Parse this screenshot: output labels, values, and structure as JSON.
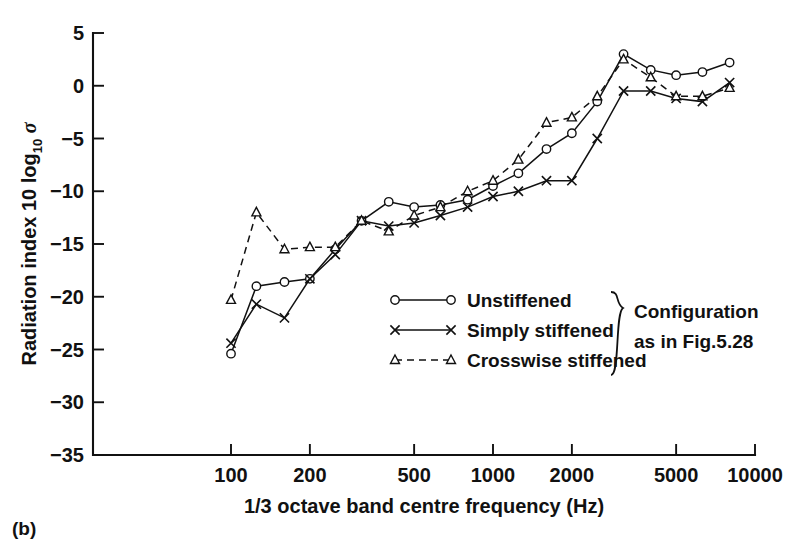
{
  "panel_label": "(b)",
  "axes": {
    "y_title_prefix": "Radiation index 10 log",
    "y_title_sub": "10",
    "y_title_symbol": "σ",
    "x_title": "1/3 octave band centre frequency (Hz)",
    "y_ticks": [
      "5",
      "0",
      "−5",
      "−10",
      "−15",
      "−20",
      "−25",
      "−30",
      "−35"
    ],
    "x_ticks": [
      "100",
      "200",
      "500",
      "1000",
      "2000",
      "5000",
      "10000"
    ]
  },
  "legend": {
    "items": [
      {
        "label": "Unstiffened",
        "marker": "circle",
        "dash": false
      },
      {
        "label": "Simply stiffened",
        "marker": "cross",
        "dash": false
      },
      {
        "label": "Crosswise stiffened",
        "marker": "triangle",
        "dash": true
      }
    ],
    "note_line1": "Configuration",
    "note_line2": "as in Fig.5.28"
  },
  "chart_data": {
    "type": "line",
    "title": "",
    "xlabel": "1/3 octave band centre frequency (Hz)",
    "ylabel": "Radiation index 10 log10 σ",
    "xscale": "log",
    "xlim": [
      80,
      10000
    ],
    "ylim": [
      -35,
      5
    ],
    "grid": false,
    "legend_position": "center-right",
    "x_tick_values": [
      100,
      200,
      500,
      1000,
      2000,
      5000,
      10000
    ],
    "y_tick_values": [
      5,
      0,
      -5,
      -10,
      -15,
      -20,
      -25,
      -30,
      -35
    ],
    "series": [
      {
        "name": "Unstiffened",
        "marker": "circle",
        "linestyle": "solid",
        "x": [
          100,
          125,
          160,
          200,
          250,
          315,
          400,
          500,
          630,
          800,
          1000,
          1250,
          1600,
          2000,
          2500,
          3150,
          4000,
          5000,
          6300,
          8000
        ],
        "values": [
          -25.4,
          -19.0,
          -18.6,
          -18.3,
          -15.5,
          -12.8,
          -11.0,
          -11.5,
          -11.3,
          -10.8,
          -9.5,
          -8.3,
          -6.0,
          -4.5,
          -1.5,
          3.0,
          1.5,
          1.0,
          1.3,
          2.2
        ]
      },
      {
        "name": "Simply stiffened",
        "marker": "cross",
        "linestyle": "solid",
        "x": [
          100,
          125,
          160,
          200,
          250,
          315,
          400,
          500,
          630,
          800,
          1000,
          1250,
          1600,
          2000,
          2500,
          3150,
          4000,
          5000,
          6300,
          8000
        ],
        "values": [
          -24.4,
          -20.7,
          -22.0,
          -18.3,
          -16.0,
          -12.8,
          -13.3,
          -13.0,
          -12.3,
          -11.5,
          -10.5,
          -10.0,
          -9.0,
          -9.0,
          -5.0,
          -0.5,
          -0.5,
          -1.2,
          -1.5,
          0.3
        ]
      },
      {
        "name": "Crosswise stiffened",
        "marker": "triangle",
        "linestyle": "dashed",
        "x": [
          100,
          125,
          160,
          200,
          250,
          315,
          400,
          500,
          630,
          800,
          1000,
          1250,
          1600,
          2000,
          2500,
          3150,
          4000,
          5000,
          6300,
          8000
        ],
        "values": [
          -20.3,
          -12.0,
          -15.5,
          -15.3,
          -15.3,
          -12.8,
          -13.8,
          -12.3,
          -11.5,
          -10.0,
          -9.0,
          -7.0,
          -3.5,
          -3.0,
          -1.0,
          2.5,
          0.8,
          -1.0,
          -1.0,
          -0.2
        ]
      }
    ]
  }
}
